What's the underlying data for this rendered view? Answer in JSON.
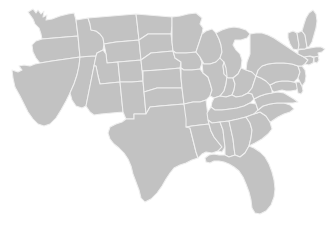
{
  "map": {
    "title": "United States",
    "subtitle": "",
    "region": "Contiguous United States",
    "projection": "albers-usa",
    "background_color": "#ffffff",
    "land_fill_color": "#c2c2c2",
    "border_color": "#efefef",
    "border_width_px": 1,
    "labels_visible": false,
    "legend_visible": false,
    "graticule_visible": false,
    "width_px": 330,
    "height_px": 230,
    "state_count": 48,
    "states": [
      {
        "code": "WA",
        "name": "Washington"
      },
      {
        "code": "OR",
        "name": "Oregon"
      },
      {
        "code": "CA",
        "name": "California"
      },
      {
        "code": "NV",
        "name": "Nevada"
      },
      {
        "code": "ID",
        "name": "Idaho"
      },
      {
        "code": "MT",
        "name": "Montana"
      },
      {
        "code": "WY",
        "name": "Wyoming"
      },
      {
        "code": "UT",
        "name": "Utah"
      },
      {
        "code": "AZ",
        "name": "Arizona"
      },
      {
        "code": "CO",
        "name": "Colorado"
      },
      {
        "code": "NM",
        "name": "New Mexico"
      },
      {
        "code": "ND",
        "name": "North Dakota"
      },
      {
        "code": "SD",
        "name": "South Dakota"
      },
      {
        "code": "NE",
        "name": "Nebraska"
      },
      {
        "code": "KS",
        "name": "Kansas"
      },
      {
        "code": "OK",
        "name": "Oklahoma"
      },
      {
        "code": "TX",
        "name": "Texas"
      },
      {
        "code": "MN",
        "name": "Minnesota"
      },
      {
        "code": "IA",
        "name": "Iowa"
      },
      {
        "code": "MO",
        "name": "Missouri"
      },
      {
        "code": "AR",
        "name": "Arkansas"
      },
      {
        "code": "LA",
        "name": "Louisiana"
      },
      {
        "code": "WI",
        "name": "Wisconsin"
      },
      {
        "code": "IL",
        "name": "Illinois"
      },
      {
        "code": "MI",
        "name": "Michigan"
      },
      {
        "code": "IN",
        "name": "Indiana"
      },
      {
        "code": "OH",
        "name": "Ohio"
      },
      {
        "code": "KY",
        "name": "Kentucky"
      },
      {
        "code": "TN",
        "name": "Tennessee"
      },
      {
        "code": "MS",
        "name": "Mississippi"
      },
      {
        "code": "AL",
        "name": "Alabama"
      },
      {
        "code": "GA",
        "name": "Georgia"
      },
      {
        "code": "FL",
        "name": "Florida"
      },
      {
        "code": "SC",
        "name": "South Carolina"
      },
      {
        "code": "NC",
        "name": "North Carolina"
      },
      {
        "code": "VA",
        "name": "Virginia"
      },
      {
        "code": "WV",
        "name": "West Virginia"
      },
      {
        "code": "MD",
        "name": "Maryland"
      },
      {
        "code": "DE",
        "name": "Delaware"
      },
      {
        "code": "PA",
        "name": "Pennsylvania"
      },
      {
        "code": "NJ",
        "name": "New Jersey"
      },
      {
        "code": "NY",
        "name": "New York"
      },
      {
        "code": "CT",
        "name": "Connecticut"
      },
      {
        "code": "RI",
        "name": "Rhode Island"
      },
      {
        "code": "MA",
        "name": "Massachusetts"
      },
      {
        "code": "VT",
        "name": "Vermont"
      },
      {
        "code": "NH",
        "name": "New Hampshire"
      },
      {
        "code": "ME",
        "name": "Maine"
      }
    ]
  }
}
